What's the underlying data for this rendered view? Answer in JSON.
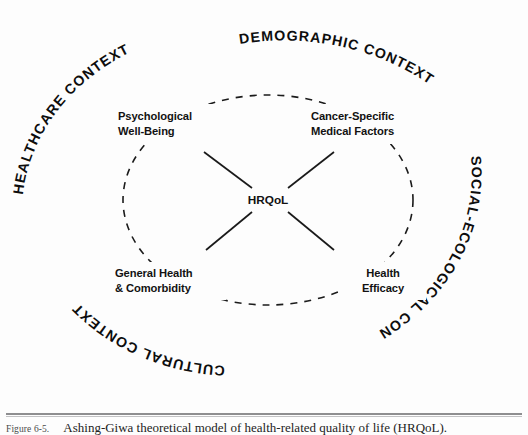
{
  "figure": {
    "caption_number": "Figure 6-5.",
    "caption_body": "Ashing-Giwa theoretical model of health-related quality of life (HRQoL).",
    "background_color": "#fdfdfd",
    "ink_color": "#1a1a1a"
  },
  "diagram": {
    "type": "conceptual-model",
    "center": {
      "label": "HRQoL"
    },
    "domains": [
      {
        "id": "psychological-well-being",
        "line1": "Psychological",
        "line2": "Well-Being",
        "position": "top-left",
        "anchor": "start"
      },
      {
        "id": "cancer-specific-medical-factors",
        "line1": "Cancer-Specific",
        "line2": "Medical Factors",
        "position": "top-right",
        "anchor": "start"
      },
      {
        "id": "general-health-comorbidity",
        "line1": "General Health",
        "line2": "& Comorbidity",
        "position": "bottom-left",
        "anchor": "start"
      },
      {
        "id": "health-efficacy",
        "line1": "Health",
        "line2": "Efficacy",
        "position": "bottom-right",
        "anchor": "middle"
      }
    ],
    "contexts": [
      {
        "id": "healthcare-context",
        "label": "HEALTHCARE CONTEXT",
        "position": "upper-left"
      },
      {
        "id": "demographic-context",
        "label": "DEMOGRAPHIC CONTEXT",
        "position": "top"
      },
      {
        "id": "social-ecological-context",
        "label": "SOCIAL-ECOLOGICAL CONTEXT",
        "position": "right"
      },
      {
        "id": "cultural-context",
        "label": "CULTURAL CONTEXT",
        "position": "bottom-left"
      }
    ],
    "inner_boundary": {
      "style": "dashed-ellipse"
    },
    "connectors": {
      "count": 4,
      "style": "solid-line",
      "pattern": "x-cross-to-center"
    }
  }
}
